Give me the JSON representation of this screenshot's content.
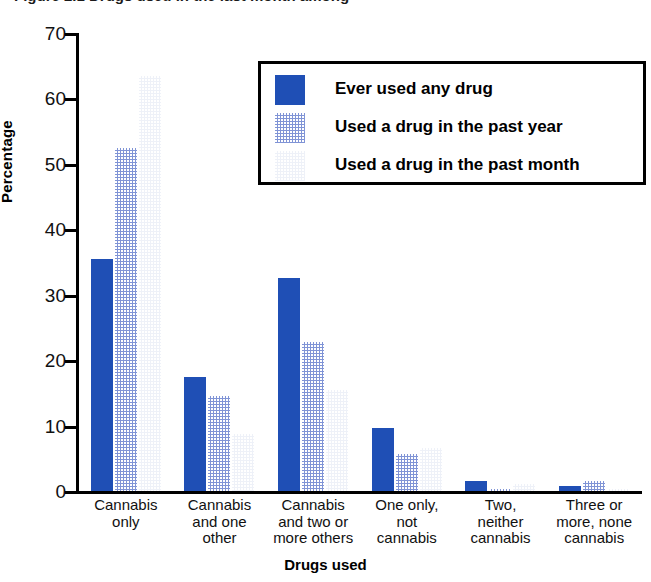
{
  "figure": {
    "title_fragment": "Figure 2.1 Drugs used in the last month among",
    "title_visible": false
  },
  "chart_data": {
    "type": "bar",
    "title": "",
    "xlabel": "Drugs used",
    "ylabel": "Percentage",
    "ylim": [
      0,
      70
    ],
    "yticks": [
      0,
      10,
      20,
      30,
      40,
      50,
      60,
      70
    ],
    "grid": false,
    "legend_position": "top-right",
    "categories": [
      "Cannabis only",
      "Cannabis and one other",
      "Cannabis and two or more others",
      "One only, not cannabis",
      "Two, neither cannabis",
      "Three or more, none cannabis"
    ],
    "category_lines": [
      [
        "Cannabis",
        "only"
      ],
      [
        "Cannabis",
        "and one",
        "other"
      ],
      [
        "Cannabis",
        "and two or",
        "more others"
      ],
      [
        "One only,",
        "not",
        "cannabis"
      ],
      [
        "Two,",
        "neither",
        "cannabis"
      ],
      [
        "Three or",
        "more, none",
        "cannabis"
      ]
    ],
    "series": [
      {
        "name": "Ever used any drug",
        "color": "#1f4fb5",
        "values": [
          35.5,
          17.5,
          32.5,
          9.7,
          1.5,
          0.7
        ]
      },
      {
        "name": "Used a drug in the past year",
        "color": "#8094d6",
        "values": [
          52.5,
          14.5,
          22.7,
          5.7,
          0.3,
          1.5
        ]
      },
      {
        "name": "Used a drug in the past month",
        "color": "#eef1f8",
        "values": [
          63.5,
          8.7,
          15.5,
          6.6,
          1.0,
          0.3
        ]
      }
    ]
  },
  "axis": {
    "y_tick_labels": [
      "70",
      "60",
      "50",
      "40",
      "30",
      "20",
      "10",
      "0"
    ],
    "y_title": "Percentage",
    "x_title": "Drugs used"
  },
  "legend": {
    "items": [
      {
        "label": "Ever used any drug",
        "swatch": "solid-blue-swatch"
      },
      {
        "label": "Used a drug in the past year",
        "swatch": "medium-blue-swatch"
      },
      {
        "label": "Used a drug in the past month",
        "swatch": "light-blue-swatch"
      }
    ]
  }
}
